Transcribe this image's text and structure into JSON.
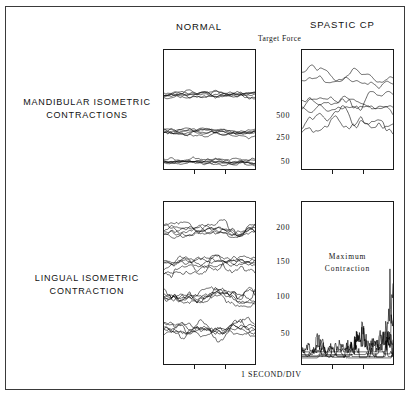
{
  "figure": {
    "background": "#ffffff",
    "frame_color": "#3a3a3a",
    "trace_color": "#000000",
    "column_headers": {
      "left": "NORMAL",
      "right": "SPASTIC  CP"
    },
    "target_force_label": "Target Force",
    "row_labels": {
      "top_line1": "MANDIBULAR    ISOMETRIC",
      "top_line2": "CONTRACTIONS",
      "bottom_line1": "LINGUAL    ISOMETRIC",
      "bottom_line2": "CONTRACTION"
    },
    "panel_annotation_line1": "Maximum",
    "panel_annotation_line2": "Contraction",
    "footer_caption": "1  SECOND/DIV"
  },
  "chart_data": [
    {
      "type": "line",
      "name": "mandibular-normal",
      "title": "NORMAL",
      "row": "MANDIBULAR ISOMETRIC CONTRACTIONS",
      "xlabel": "1 SECOND/DIV",
      "ylabel": "Target Force",
      "ytick_labels": [
        "500",
        "250",
        "50"
      ],
      "ytick_values": [
        500,
        250,
        50
      ],
      "ylim": [
        0,
        800
      ],
      "xlim": [
        0,
        6
      ],
      "xtick_count": 2,
      "grid": false,
      "legend": "none",
      "series_count": 6,
      "target_levels": [
        500,
        250,
        50
      ],
      "noise_amplitude": 26,
      "seed": 1117
    },
    {
      "type": "line",
      "name": "mandibular-spastic",
      "title": "SPASTIC CP",
      "row": "MANDIBULAR ISOMETRIC CONTRACTIONS",
      "xlabel": "1 SECOND/DIV",
      "ylabel": "Target Force",
      "ytick_labels": [
        "500",
        "250",
        "50"
      ],
      "ytick_values": [
        500,
        250,
        50
      ],
      "ylim": [
        0,
        800
      ],
      "xlim": [
        0,
        6
      ],
      "xtick_count": 2,
      "grid": false,
      "legend": "none",
      "series_count": 7,
      "target_levels": [
        640,
        560,
        470,
        420,
        390,
        340,
        300
      ],
      "noise_amplitude": 52,
      "seed": 4821
    },
    {
      "type": "line",
      "name": "lingual-normal",
      "title": "NORMAL",
      "row": "LINGUAL ISOMETRIC CONTRACTION",
      "xlabel": "1 SECOND/DIV",
      "ylabel": "Target Force",
      "ytick_labels": [
        "200",
        "150",
        "100",
        "50"
      ],
      "ytick_values": [
        200,
        150,
        100,
        50
      ],
      "ylim": [
        0,
        240
      ],
      "xlim": [
        0,
        6
      ],
      "xtick_count": 2,
      "grid": false,
      "legend": "none",
      "series_count": 6,
      "target_levels": [
        200,
        150,
        100,
        50
      ],
      "noise_amplitude": 13,
      "seed": 2903
    },
    {
      "type": "line",
      "name": "lingual-spastic",
      "title": "SPASTIC CP",
      "row": "LINGUAL ISOMETRIC CONTRACTION",
      "xlabel": "1 SECOND/DIV",
      "ylabel": "Target Force",
      "ytick_labels": [
        "200",
        "150",
        "100",
        "50"
      ],
      "ytick_values": [
        200,
        150,
        100,
        50
      ],
      "ylim": [
        0,
        240
      ],
      "xlim": [
        0,
        6
      ],
      "xtick_count": 2,
      "grid": false,
      "legend": "none",
      "annotation": "Maximum Contraction",
      "series_count": 7,
      "target_levels": [
        18,
        15,
        14,
        12,
        11,
        10,
        9
      ],
      "noise_amplitude": 24,
      "seed": 7356
    }
  ],
  "panels": {
    "mandibular_normal": {
      "x": 163,
      "y": 49,
      "w": 93,
      "h": 121
    },
    "mandibular_spastic": {
      "x": 301,
      "y": 49,
      "w": 93,
      "h": 121
    },
    "lingual_normal": {
      "x": 163,
      "y": 201,
      "w": 93,
      "h": 164
    },
    "lingual_spastic": {
      "x": 301,
      "y": 201,
      "w": 93,
      "h": 164
    }
  },
  "ytick_positions": {
    "mandibular": [
      {
        "label": "500",
        "top": 111
      },
      {
        "label": "250",
        "top": 133
      },
      {
        "label": "50",
        "top": 157
      }
    ],
    "lingual": [
      {
        "label": "200",
        "top": 223
      },
      {
        "label": "150",
        "top": 257
      },
      {
        "label": "100",
        "top": 292
      },
      {
        "label": "50",
        "top": 329
      }
    ]
  }
}
